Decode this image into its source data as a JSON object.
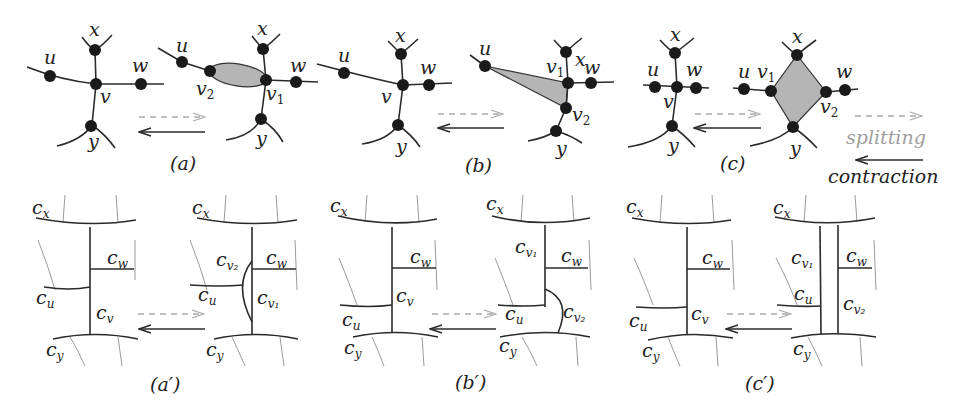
{
  "figure": {
    "panels_top": [
      {
        "caption": "(a)",
        "labels": {
          "x": "x",
          "u": "u",
          "w": "w",
          "v": "v",
          "y": "y",
          "v1": "v",
          "v1_sub": "1",
          "v2": "v",
          "v2_sub": "2"
        }
      },
      {
        "caption": "(b)",
        "labels": {
          "x": "x",
          "u": "u",
          "w": "w",
          "v": "v",
          "y": "y",
          "v1": "v",
          "v1_sub": "1",
          "v2": "v",
          "v2_sub": "2"
        }
      },
      {
        "caption": "(c)",
        "labels": {
          "x": "x",
          "u": "u",
          "w": "w",
          "v": "v",
          "y": "y",
          "v1": "v",
          "v1_sub": "1",
          "v2": "v",
          "v2_sub": "2"
        }
      }
    ],
    "panels_bottom": [
      {
        "caption": "(a′)",
        "labels": {
          "cx": "c",
          "cx_sub": "x",
          "cw": "c",
          "cw_sub": "w",
          "cu": "c",
          "cu_sub": "u",
          "cv": "c",
          "cv_sub": "v",
          "cy": "c",
          "cy_sub": "y",
          "cv1": "c",
          "cv1_sub": "v₁",
          "cv2": "c",
          "cv2_sub": "v₂"
        }
      },
      {
        "caption": "(b′)",
        "labels": {
          "cx": "c",
          "cx_sub": "x",
          "cw": "c",
          "cw_sub": "w",
          "cu": "c",
          "cu_sub": "u",
          "cv": "c",
          "cv_sub": "v",
          "cy": "c",
          "cy_sub": "y",
          "cv1": "c",
          "cv1_sub": "v₁",
          "cv2": "c",
          "cv2_sub": "v₂"
        }
      },
      {
        "caption": "(c′)",
        "labels": {
          "cx": "c",
          "cx_sub": "x",
          "cw": "c",
          "cw_sub": "w",
          "cu": "c",
          "cu_sub": "u",
          "cv": "c",
          "cv_sub": "v",
          "cy": "c",
          "cy_sub": "y",
          "cv1": "c",
          "cv1_sub": "v₁",
          "cv2": "c",
          "cv2_sub": "v₂"
        }
      }
    ],
    "legend": {
      "splitting": "splitting",
      "contraction": "contraction"
    },
    "colors": {
      "edge": "#2a2a2a",
      "face_fill": "#b5b5b5",
      "splitting_arrow": "#a9a9a9",
      "contraction_arrow": "#2a2a2a",
      "thin_curve": "#9a9a9a"
    }
  }
}
